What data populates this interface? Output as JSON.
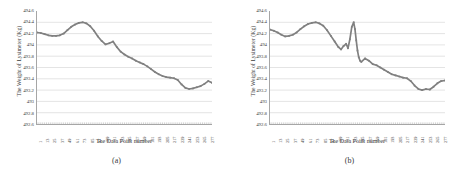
{
  "figure": {
    "panels": [
      {
        "caption": "(a)",
        "chart_data": {
          "type": "line",
          "title": "",
          "xlabel": "The Data Point number",
          "ylabel": "The Weight of Lysimeter (Kg)",
          "ylim": [
            492.6,
            494.6
          ],
          "xlim": [
            1,
            277
          ],
          "grid": true,
          "legend": "none",
          "yticks": [
            "494.6",
            "494.4",
            "494.2",
            "494",
            "493.8",
            "493.6",
            "493.4",
            "493.2",
            "493",
            "492.8",
            "492.6"
          ],
          "ytick_values": [
            494.6,
            494.4,
            494.2,
            494.0,
            493.8,
            493.6,
            493.4,
            493.2,
            493.0,
            492.8,
            492.6
          ],
          "xticks": [
            "1",
            "13",
            "25",
            "37",
            "49",
            "61",
            "73",
            "85",
            "97",
            "109",
            "121",
            "133",
            "145",
            "157",
            "169",
            "181",
            "193",
            "205",
            "217",
            "229",
            "241",
            "253",
            "265",
            "277"
          ],
          "series": [
            {
              "name": "Lysimeter weight (filtered)",
              "color": "#808080",
              "x": [
                1,
                7,
                13,
                19,
                25,
                31,
                37,
                43,
                49,
                55,
                61,
                67,
                73,
                79,
                85,
                91,
                97,
                103,
                109,
                115,
                121,
                127,
                133,
                139,
                145,
                151,
                157,
                163,
                169,
                175,
                181,
                187,
                193,
                199,
                205,
                211,
                217,
                223,
                229,
                235,
                241,
                247,
                253,
                259,
                265,
                271,
                277
              ],
              "y": [
                494.22,
                494.21,
                494.19,
                494.17,
                494.16,
                494.16,
                494.17,
                494.2,
                494.26,
                494.32,
                494.36,
                494.39,
                494.4,
                494.38,
                494.33,
                494.25,
                494.15,
                494.07,
                494.01,
                494.03,
                494.06,
                493.96,
                493.88,
                493.83,
                493.79,
                493.76,
                493.72,
                493.69,
                493.66,
                493.62,
                493.57,
                493.52,
                493.48,
                493.45,
                493.43,
                493.42,
                493.41,
                493.38,
                493.3,
                493.24,
                493.22,
                493.23,
                493.25,
                493.27,
                493.31,
                493.36,
                493.33
              ]
            }
          ]
        }
      },
      {
        "caption": "(b)",
        "chart_data": {
          "type": "line",
          "title": "",
          "xlabel": "The Data Point number",
          "ylabel": "The Weight of Lysimeter (Kg)",
          "ylim": [
            492.6,
            494.6
          ],
          "xlim": [
            1,
            277
          ],
          "grid": true,
          "legend": "none",
          "yticks": [
            "494.6",
            "494.4",
            "494.2",
            "494",
            "493.8",
            "493.6",
            "493.4",
            "493.2",
            "493",
            "492.8",
            "492.6"
          ],
          "ytick_values": [
            494.6,
            494.4,
            494.2,
            494.0,
            493.8,
            493.6,
            493.4,
            493.2,
            493.0,
            492.8,
            492.6
          ],
          "xticks": [
            "1",
            "13",
            "25",
            "37",
            "49",
            "61",
            "73",
            "85",
            "97",
            "109",
            "121",
            "133",
            "145",
            "157",
            "169",
            "181",
            "193",
            "205",
            "217",
            "229",
            "241",
            "253",
            "265",
            "277"
          ],
          "series": [
            {
              "name": "Lysimeter weight (raw, with spike)",
              "color": "#808080",
              "x": [
                1,
                7,
                13,
                19,
                25,
                31,
                37,
                43,
                49,
                55,
                61,
                67,
                73,
                79,
                85,
                91,
                97,
                103,
                109,
                113,
                117,
                121,
                124,
                127,
                130,
                133,
                135,
                137,
                139,
                141,
                143,
                145,
                151,
                157,
                163,
                169,
                175,
                181,
                187,
                193,
                199,
                205,
                211,
                217,
                223,
                229,
                235,
                241,
                247,
                253,
                259,
                265,
                271,
                277
              ],
              "y": [
                494.27,
                494.25,
                494.22,
                494.18,
                494.15,
                494.16,
                494.18,
                494.22,
                494.28,
                494.33,
                494.37,
                494.39,
                494.4,
                494.38,
                494.34,
                494.26,
                494.16,
                494.06,
                493.96,
                493.92,
                493.98,
                494.02,
                493.94,
                494.1,
                494.32,
                494.4,
                494.28,
                494.08,
                493.9,
                493.78,
                493.72,
                493.7,
                493.76,
                493.72,
                493.66,
                493.64,
                493.6,
                493.56,
                493.52,
                493.48,
                493.46,
                493.44,
                493.42,
                493.41,
                493.36,
                493.28,
                493.22,
                493.2,
                493.22,
                493.21,
                493.26,
                493.32,
                493.36,
                493.37
              ]
            }
          ]
        }
      }
    ]
  }
}
